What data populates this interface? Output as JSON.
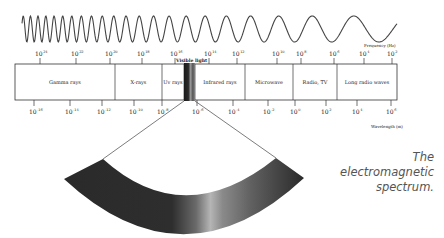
{
  "figure": {
    "caption_lines": [
      "The",
      "electromagnetic",
      "spectrum."
    ],
    "frequency_axis": {
      "label": "Frequency (Hz)",
      "ticks": [
        {
          "x": 40,
          "exp": "24"
        },
        {
          "x": 76,
          "exp": "22"
        },
        {
          "x": 110,
          "exp": "20"
        },
        {
          "x": 142,
          "exp": "18"
        },
        {
          "x": 175,
          "exp": "16"
        },
        {
          "x": 209,
          "exp": "14"
        },
        {
          "x": 237,
          "exp": "12"
        },
        {
          "x": 277,
          "exp": "10"
        },
        {
          "x": 301,
          "exp": "8"
        },
        {
          "x": 334,
          "exp": "6"
        },
        {
          "x": 364,
          "exp": "4"
        },
        {
          "x": 392,
          "exp": "2"
        }
      ]
    },
    "wavelength_axis": {
      "label": "Wavelength (m)",
      "ticks": [
        {
          "x": 34,
          "exp": "-16"
        },
        {
          "x": 70,
          "exp": "-14"
        },
        {
          "x": 102,
          "exp": "-12"
        },
        {
          "x": 134,
          "exp": "-10"
        },
        {
          "x": 162,
          "exp": "-8"
        },
        {
          "x": 197,
          "exp": "-6"
        },
        {
          "x": 233,
          "exp": "-4"
        },
        {
          "x": 268,
          "exp": "-2"
        },
        {
          "x": 295,
          "exp": "0"
        },
        {
          "x": 326,
          "exp": "2"
        },
        {
          "x": 357,
          "exp": "4"
        },
        {
          "x": 391,
          "exp": "6"
        }
      ]
    },
    "bands": [
      {
        "label": "Gamma rays",
        "x0": 15,
        "x1": 115
      },
      {
        "label": "X-rays",
        "x0": 115,
        "x1": 162
      },
      {
        "label": "Uv rays",
        "x0": 162,
        "x1": 184
      },
      {
        "label": "",
        "x0": 184,
        "x1": 195
      },
      {
        "label": "Infrared rays",
        "x0": 195,
        "x1": 245
      },
      {
        "label": "Microwave",
        "x0": 245,
        "x1": 293
      },
      {
        "label": "Radio, TV",
        "x0": 293,
        "x1": 337
      },
      {
        "label": "Long radio waves",
        "x0": 337,
        "x1": 397
      }
    ],
    "visible_light_label": "Visible light",
    "colors": {
      "line": "#333333",
      "text": "#222222",
      "caption": "#555555"
    }
  }
}
